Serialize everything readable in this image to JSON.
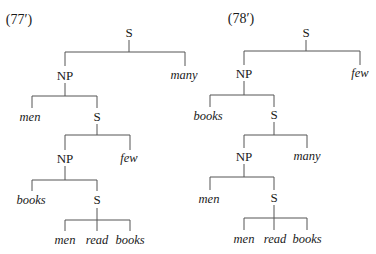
{
  "trees": [
    {
      "label": "(77′)",
      "nodes": {
        "root": "S",
        "np1": "NP",
        "q1": "many",
        "n1": "men",
        "s1": "S",
        "np2": "NP",
        "q2": "few",
        "n2": "books",
        "s2": "S",
        "w1": "men",
        "w2": "read",
        "w3": "books"
      }
    },
    {
      "label": "(78′)",
      "nodes": {
        "root": "S",
        "np1": "NP",
        "q1": "few",
        "n1": "books",
        "s1": "S",
        "np2": "NP",
        "q2": "many",
        "n2": "men",
        "s2": "S",
        "w1": "men",
        "w2": "read",
        "w3": "books"
      }
    }
  ]
}
